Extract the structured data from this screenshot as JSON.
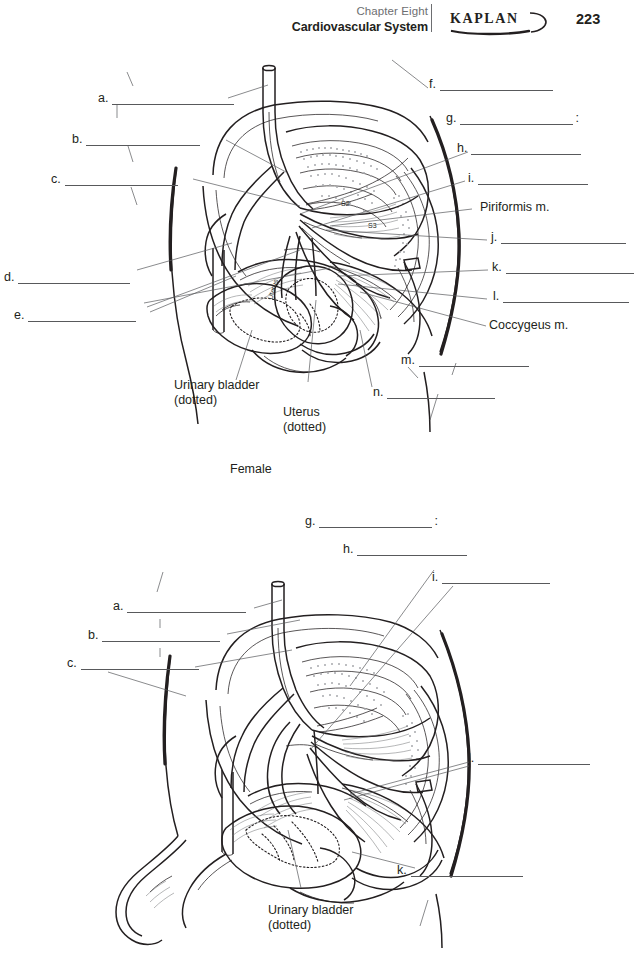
{
  "header": {
    "chapter": "Chapter Eight",
    "system": "Cardiovascular System",
    "brand": "KAPLAN",
    "page_number": "223"
  },
  "figure_female": {
    "caption": "Female",
    "inline_labels": {
      "uterus": "Uterus",
      "vertebra_s2": "S2",
      "vertebra_s3": "S3"
    },
    "named_labels": [
      {
        "id": "piriformis",
        "text": "Piriformis m."
      },
      {
        "id": "coccygeus",
        "text": "Coccygeus m."
      },
      {
        "id": "urinary-bladder",
        "line1": "Urinary bladder",
        "line2": "(dotted)"
      },
      {
        "id": "uterus",
        "line1": "Uterus",
        "line2": "(dotted)"
      }
    ],
    "blank_labels": [
      {
        "letter": "a.",
        "value": "",
        "trailing": ""
      },
      {
        "letter": "b.",
        "value": "",
        "trailing": ""
      },
      {
        "letter": "c.",
        "value": "",
        "trailing": ""
      },
      {
        "letter": "d.",
        "value": "",
        "trailing": ""
      },
      {
        "letter": "e.",
        "value": "",
        "trailing": ""
      },
      {
        "letter": "f.",
        "value": "",
        "trailing": ""
      },
      {
        "letter": "g.",
        "value": "",
        "trailing": ":"
      },
      {
        "letter": "h.",
        "value": "",
        "trailing": ""
      },
      {
        "letter": "i.",
        "value": "",
        "trailing": ""
      },
      {
        "letter": "j.",
        "value": "",
        "trailing": ""
      },
      {
        "letter": "k.",
        "value": "",
        "trailing": ""
      },
      {
        "letter": "l.",
        "value": "",
        "trailing": ""
      },
      {
        "letter": "m.",
        "value": "",
        "trailing": ""
      },
      {
        "letter": "n.",
        "value": "",
        "trailing": ""
      }
    ]
  },
  "figure_male": {
    "caption": "",
    "named_labels": [
      {
        "id": "urinary-bladder",
        "line1": "Urinary bladder",
        "line2": "(dotted)"
      }
    ],
    "blank_labels": [
      {
        "letter": "a.",
        "value": "",
        "trailing": ""
      },
      {
        "letter": "b.",
        "value": "",
        "trailing": ""
      },
      {
        "letter": "c.",
        "value": "",
        "trailing": ""
      },
      {
        "letter": "g.",
        "value": "",
        "trailing": ":"
      },
      {
        "letter": "h.",
        "value": "",
        "trailing": ""
      },
      {
        "letter": "i.",
        "value": "",
        "trailing": ""
      },
      {
        "letter": "k.",
        "value": "",
        "trailing": ""
      },
      {
        "letter": "l.",
        "value": "",
        "trailing": ""
      }
    ]
  },
  "colors": {
    "ink": "#231f20",
    "rule": "#58595b",
    "muted": "#6d6e71",
    "stipple": "#a7a9ac"
  }
}
